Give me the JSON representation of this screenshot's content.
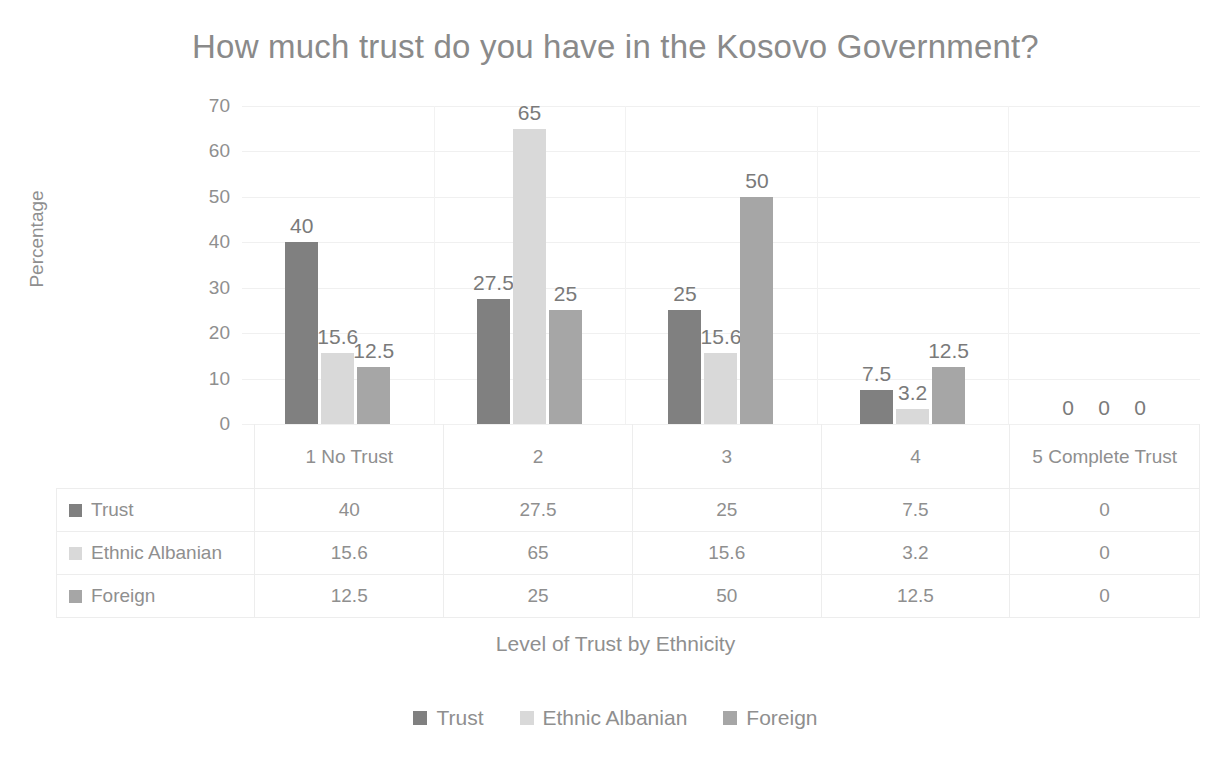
{
  "chart_data": {
    "type": "bar",
    "title": "How much trust do you have in the Kosovo Government?",
    "xlabel": "Level of Trust by Ethnicity",
    "ylabel": "Percentage",
    "categories": [
      "1 No Trust",
      "2",
      "3",
      "4",
      "5 Complete Trust"
    ],
    "series": [
      {
        "name": "Trust",
        "color": "#808080",
        "values": [
          40,
          27.5,
          25,
          7.5,
          0
        ],
        "labels": [
          "40",
          "27.5",
          "25",
          "7.5",
          "0"
        ]
      },
      {
        "name": "Ethnic Albanian",
        "color": "#d9d9d9",
        "values": [
          15.6,
          65,
          15.6,
          3.2,
          0
        ],
        "labels": [
          "15.6",
          "65",
          "15.6",
          "3.2",
          "0"
        ]
      },
      {
        "name": "Foreign",
        "color": "#a6a6a6",
        "values": [
          12.5,
          25,
          50,
          12.5,
          0
        ],
        "labels": [
          "12.5",
          "25",
          "50",
          "12.5",
          "0"
        ]
      }
    ],
    "ylim": [
      0,
      70
    ],
    "yticks": [
      "70",
      "60",
      "50",
      "40",
      "30",
      "20",
      "10",
      "0"
    ],
    "ytick_values": [
      70,
      60,
      50,
      40,
      30,
      20,
      10,
      0
    ],
    "grid": true,
    "legend_position": "bottom",
    "data_table_visible": true
  },
  "table": {
    "rows": [
      {
        "name": "Trust",
        "values": [
          "40",
          "27.5",
          "25",
          "7.5",
          "0"
        ]
      },
      {
        "name": "Ethnic Albanian",
        "values": [
          "15.6",
          "65",
          "15.6",
          "3.2",
          "0"
        ]
      },
      {
        "name": "Foreign",
        "values": [
          "12.5",
          "25",
          "50",
          "12.5",
          "0"
        ]
      }
    ]
  }
}
